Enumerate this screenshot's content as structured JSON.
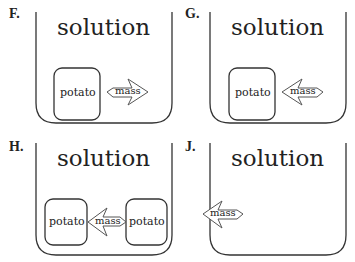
{
  "panels": [
    {
      "label": "F.",
      "title": "solution",
      "potatoes": [
        "potato"
      ],
      "arrow": {
        "text": "mass",
        "direction": "right",
        "meaning": "mass moves out of potato into solution"
      }
    },
    {
      "label": "G.",
      "title": "solution",
      "potatoes": [
        "potato"
      ],
      "arrow": {
        "text": "mass",
        "direction": "left",
        "meaning": "mass moves from solution into potato"
      }
    },
    {
      "label": "H.",
      "title": "solution",
      "potatoes": [
        "potato",
        "potato"
      ],
      "arrow": {
        "text": "mass",
        "direction": "left",
        "meaning": "mass moves from right potato to left potato"
      }
    },
    {
      "label": "J.",
      "title": "solution",
      "potatoes": [],
      "arrow": {
        "text": "mass",
        "direction": "left",
        "meaning": "mass moves out of container"
      }
    }
  ],
  "colors": {
    "stroke": "#333333",
    "text": "#222222",
    "background": "#ffffff"
  }
}
